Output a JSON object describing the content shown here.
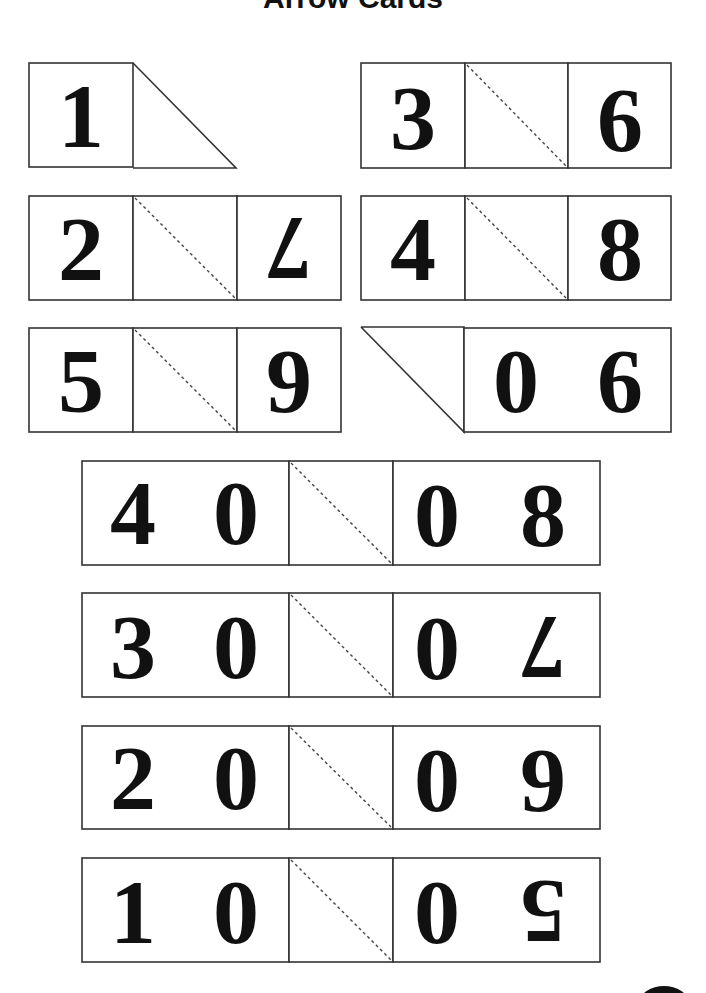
{
  "page": {
    "title": "Arrow Cards"
  },
  "cards": {
    "one": {
      "left": "1"
    },
    "three_six": {
      "left": "3",
      "right": "6"
    },
    "two_seven": {
      "left": "2",
      "right": "7"
    },
    "four_eight": {
      "left": "4",
      "right": "8"
    },
    "five_nine": {
      "left": "5",
      "right": "9"
    },
    "zero_six": {
      "tens": "0",
      "ones": "6"
    },
    "forty_eight": {
      "left_tens": "4",
      "left_ones": "0",
      "right_tens": "0",
      "right_ones": "8"
    },
    "thirty_seven": {
      "left_tens": "3",
      "left_ones": "0",
      "right_tens": "0",
      "right_ones": "7"
    },
    "twenty_nine": {
      "left_tens": "2",
      "left_ones": "0",
      "right_tens": "0",
      "right_ones": "9"
    },
    "ten_five": {
      "left_tens": "1",
      "left_ones": "0",
      "right_tens": "0",
      "right_ones": "5"
    }
  },
  "colors": {
    "line": "#333333",
    "digit": "#111111",
    "background": "#ffffff"
  }
}
